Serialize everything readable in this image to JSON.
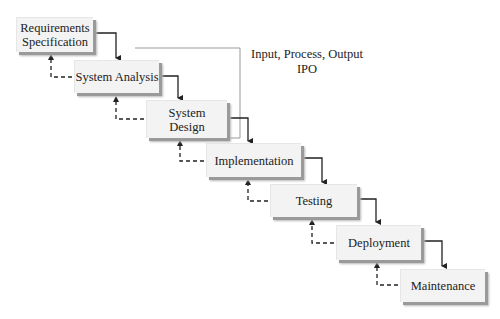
{
  "diagram": {
    "type": "waterfall-process",
    "stages": [
      {
        "label": "Requirements\nSpecification",
        "line1": "Requirements",
        "line2": "Specification"
      },
      {
        "label": "System Analysis"
      },
      {
        "label": "System\nDesign",
        "line1": "System",
        "line2": "Design"
      },
      {
        "label": "Implementation"
      },
      {
        "label": "Testing"
      },
      {
        "label": "Deployment"
      },
      {
        "label": "Maintenance"
      }
    ],
    "annotation": {
      "line1": "Input, Process, Output",
      "line2": "IPO",
      "spans": [
        "System Analysis",
        "System Design"
      ]
    },
    "edges": {
      "forward": "solid arrow to next stage",
      "feedback": "dashed arrow back to previous stage"
    }
  }
}
